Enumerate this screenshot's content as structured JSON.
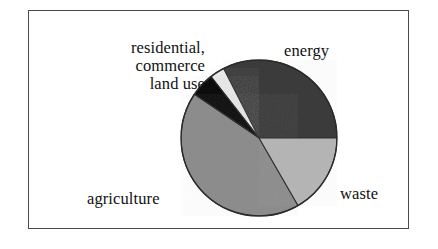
{
  "figure": {
    "frame_color": "#4a4a4a",
    "background": "#ffffff"
  },
  "labels": {
    "residential": "residential,\ncommerce\nland use",
    "energy": "energy",
    "waste": "waste",
    "agriculture": "agriculture"
  },
  "chart_data": {
    "type": "pie",
    "title": "",
    "subtitle": "",
    "xlabel": "",
    "ylabel": "",
    "legend_position": "none",
    "grid": false,
    "labels_placement": "outside-callout",
    "start_angle_deg": 0,
    "direction": "counterclockwise",
    "categories": [
      "energy",
      "residential, commerce",
      "land use",
      "agriculture",
      "waste"
    ],
    "values": [
      32.5,
      3.0,
      5.0,
      42.8,
      16.7
    ],
    "value_unit": "percent",
    "slices": [
      {
        "name": "energy",
        "label": "energy",
        "value": 32.5,
        "angle_deg": 117,
        "start_deg": 0,
        "end_deg": 117,
        "color": "#3b3b3b"
      },
      {
        "name": "residential, commerce",
        "label": "residential,\ncommerce",
        "value": 3.0,
        "angle_deg": 11,
        "start_deg": 117,
        "end_deg": 128,
        "color": "#e8e8e8"
      },
      {
        "name": "land use",
        "label": "land use",
        "value": 5.0,
        "angle_deg": 18,
        "start_deg": 128,
        "end_deg": 146,
        "color": "#0d0d0d"
      },
      {
        "name": "agriculture",
        "label": "agriculture",
        "value": 42.8,
        "angle_deg": 154,
        "start_deg": 146,
        "end_deg": 300,
        "color": "#8c8c8c"
      },
      {
        "name": "waste",
        "label": "waste",
        "value": 16.7,
        "angle_deg": 60,
        "start_deg": 300,
        "end_deg": 360,
        "color": "#b4b4b4"
      }
    ],
    "geometry": {
      "center_x": 80,
      "center_y": 80,
      "radius": 78,
      "outline_color": "#2b2b2b"
    }
  }
}
